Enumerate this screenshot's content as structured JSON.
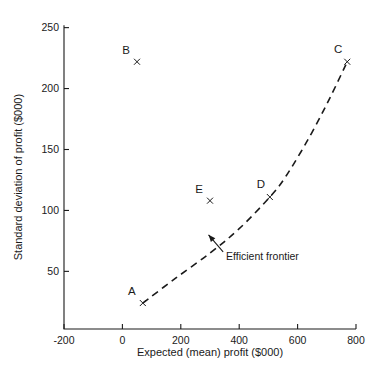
{
  "chart_data": {
    "type": "scatter",
    "title": "",
    "xlabel": "Expected (mean) profit ($000)",
    "ylabel": "Standard deviation of profit ($000)",
    "xlim": [
      -200,
      800
    ],
    "ylim": [
      0,
      250
    ],
    "xticks": [
      "-200",
      "0",
      "200",
      "400",
      "600",
      "800"
    ],
    "xtick_values": [
      -200,
      0,
      200,
      400,
      600,
      800
    ],
    "yticks": [
      "50",
      "100",
      "150",
      "200",
      "250"
    ],
    "ytick_values": [
      50,
      100,
      150,
      200,
      250
    ],
    "grid": false,
    "legend": "none",
    "marker": "x",
    "points": [
      {
        "label": "A",
        "x": 70,
        "y": 24,
        "label_dx": -11,
        "label_dy": -8
      },
      {
        "label": "B",
        "x": 50,
        "y": 222,
        "label_dx": -11,
        "label_dy": -8
      },
      {
        "label": "C",
        "x": 770,
        "y": 222,
        "label_dx": -9,
        "label_dy": -9
      },
      {
        "label": "D",
        "x": 505,
        "y": 111,
        "label_dx": -9,
        "label_dy": -9
      },
      {
        "label": "E",
        "x": 300,
        "y": 108,
        "label_dx": -11,
        "label_dy": -8
      }
    ],
    "series": [
      {
        "name": "Efficient frontier",
        "type": "line",
        "style": "dashed",
        "x": [
          70,
          180,
          300,
          400,
          505,
          560,
          640,
          710,
          770
        ],
        "y": [
          24,
          44,
          65,
          85,
          111,
          128,
          160,
          192,
          222
        ]
      }
    ],
    "annotations": [
      {
        "text": "Efficient frontier",
        "text_x": 355,
        "text_y": 62,
        "arrow_tail_x": 345,
        "arrow_tail_y": 66,
        "arrow_tip_x": 295,
        "arrow_tip_y": 80
      }
    ]
  }
}
